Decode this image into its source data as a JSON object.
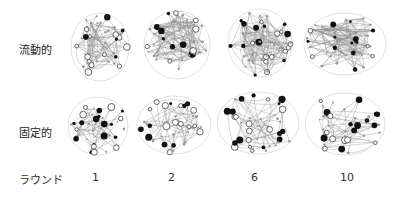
{
  "figure": {
    "row_labels": {
      "fluid": "流動的",
      "fixed": "固定的"
    },
    "axis_label": "ラウンド",
    "rounds": [
      "1",
      "2",
      "6",
      "10"
    ]
  },
  "networks": {
    "fluid": [
      {
        "round": "1",
        "density": "medium",
        "cx": 100,
        "cy": 47,
        "w": 56,
        "h": 66
      },
      {
        "round": "2",
        "density": "high",
        "cx": 177,
        "cy": 45,
        "w": 64,
        "h": 66
      },
      {
        "round": "6",
        "density": "high",
        "cx": 260,
        "cy": 43,
        "w": 62,
        "h": 66
      },
      {
        "round": "10",
        "density": "high",
        "cx": 345,
        "cy": 44,
        "w": 80,
        "h": 60
      }
    ],
    "fixed": [
      {
        "round": "1",
        "density": "sparse",
        "cx": 98,
        "cy": 126,
        "w": 58,
        "h": 56
      },
      {
        "round": "2",
        "density": "sparse",
        "cx": 174,
        "cy": 125,
        "w": 72,
        "h": 56
      },
      {
        "round": "6",
        "density": "sparse",
        "cx": 258,
        "cy": 123,
        "w": 80,
        "h": 60
      },
      {
        "round": "10",
        "density": "sparse",
        "cx": 345,
        "cy": 124,
        "w": 78,
        "h": 60
      }
    ]
  },
  "colors": {
    "node_filled": "#111111",
    "node_open_stroke": "#444444",
    "edge": "#888888",
    "text": "#222222"
  }
}
